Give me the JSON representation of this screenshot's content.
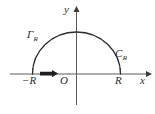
{
  "figure": {
    "background_color": "#ffffff",
    "axis_color": "#5a5a5a",
    "curve_color": "#2b2b2b",
    "width": 155,
    "height": 114
  },
  "axes": {
    "x_axis": {
      "label": "x",
      "arrow": "right",
      "origin_label": "O"
    },
    "y_axis": {
      "label": "y",
      "arrow": "up"
    }
  },
  "ticks": [
    {
      "name": "left-endpoint",
      "label": "−R",
      "value": -1
    },
    {
      "name": "right-endpoint",
      "label": "R",
      "value": 1
    }
  ],
  "contour": {
    "type": "semicircle",
    "radius_label": "R",
    "orientation": "counterclockwise",
    "arc_label_left": "Γ",
    "arc_label_left_subscript": "R",
    "arc_label_right": "C",
    "arc_label_right_subscript": "R",
    "direction_arrow": "right-along-real-axis"
  },
  "labels": {
    "gamma_r": "Γ",
    "gamma_r_sub": "R",
    "c_r": "C",
    "c_r_sub": "R",
    "origin": "O",
    "neg_r": "−R",
    "pos_r": "R",
    "x": "x",
    "y": "y"
  }
}
